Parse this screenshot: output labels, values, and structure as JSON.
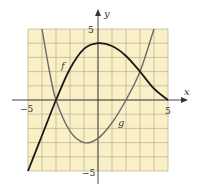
{
  "chart_data": {
    "type": "line",
    "title": "",
    "xlabel": "x",
    "ylabel": "y",
    "xlim": [
      -5,
      5
    ],
    "ylim": [
      -5,
      5
    ],
    "grid": true,
    "grid_step": 1,
    "x_tick_labels": [
      "-5",
      "5"
    ],
    "y_tick_labels": [
      "5",
      "-5"
    ],
    "legend": "none (curves labeled inline)",
    "series": [
      {
        "name": "f",
        "color": "#1a1a1a",
        "points": [
          [
            -5,
            -5
          ],
          [
            -4,
            -2.5
          ],
          [
            -3,
            0
          ],
          [
            -2,
            2.2
          ],
          [
            -1,
            3.6
          ],
          [
            0,
            4
          ],
          [
            1,
            3.8
          ],
          [
            2,
            3.1
          ],
          [
            3,
            2
          ],
          [
            4,
            0.8
          ],
          [
            5,
            0
          ]
        ]
      },
      {
        "name": "g",
        "color": "#6b6b6b",
        "points": [
          [
            -4,
            5
          ],
          [
            -3.5,
            2.2
          ],
          [
            -3,
            0
          ],
          [
            -2,
            -2.2
          ],
          [
            -1,
            -3
          ],
          [
            0,
            -2.7
          ],
          [
            1,
            -1.6
          ],
          [
            2,
            0
          ],
          [
            3,
            2
          ],
          [
            4,
            5
          ]
        ]
      }
    ],
    "annotations": [
      {
        "text": "f",
        "x": -2.5,
        "y": 2.2
      },
      {
        "text": "g",
        "x": 1.6,
        "y": -1.6
      }
    ]
  },
  "colors": {
    "background": "#f9f0c8",
    "grid": "#b8ad8a",
    "axis": "#333333"
  },
  "labels": {
    "x_axis": "x",
    "y_axis": "y",
    "x_min": "−5",
    "x_max": "5",
    "y_max": "5",
    "y_min": "−5",
    "f_label": "f",
    "g_label": "g"
  }
}
